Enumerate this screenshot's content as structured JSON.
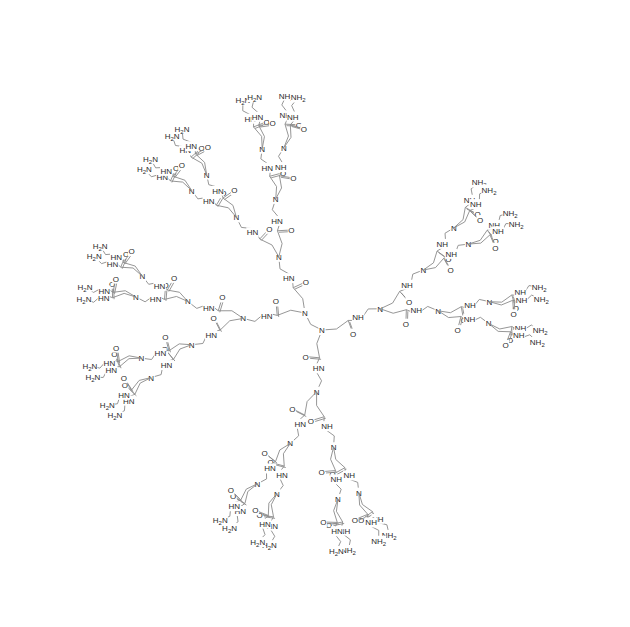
{
  "diagram": {
    "title": "",
    "type": "chemical-structure",
    "molecule": "PAMAM dendrimer, generation 3, ethylenediamine core",
    "core": {
      "label": "N",
      "atoms": [
        {
          "label": "N",
          "x": 305,
          "y": 313
        },
        {
          "label": "N",
          "x": 322,
          "y": 330
        }
      ]
    },
    "branches_per_core_atom": 2,
    "generations": 3,
    "terminal_groups": 32,
    "labels": {
      "tertiary_amine": "N",
      "amide_nh": "NH",
      "amide_hn": "HN",
      "carbonyl_o": "O",
      "terminal_amine": "NH2",
      "terminal_amine_left": "H2N",
      "amide_h": "H"
    },
    "colors": {
      "bond": "#8a8a8a",
      "text": "#2a2a2a",
      "background": "#ffffff"
    }
  }
}
